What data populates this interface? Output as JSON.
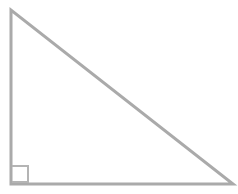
{
  "figure": {
    "type": "geometry-diagram",
    "shape_name": "right-triangle",
    "title": "",
    "caption": "",
    "background_color": "#ffffff",
    "canvas": {
      "width": 238,
      "height": 194
    },
    "stroke": {
      "color": "#aaaaaa",
      "width": 3,
      "linejoin": "miter",
      "linecap": "butt"
    },
    "fill": "none",
    "vertices": [
      {
        "label": "",
        "name": "apex-top-left",
        "x": 11,
        "y": 10
      },
      {
        "label": "",
        "name": "right-angle-bottom-left",
        "x": 11,
        "y": 184
      },
      {
        "label": "",
        "name": "bottom-right",
        "x": 233,
        "y": 184
      }
    ],
    "polygon_points": "11,10 11,184 233,184",
    "edges": [
      {
        "name": "vertical-leg",
        "from": "apex-top-left",
        "to": "right-angle-bottom-left",
        "length_px": 174
      },
      {
        "name": "horizontal-leg",
        "from": "right-angle-bottom-left",
        "to": "bottom-right",
        "length_px": 222
      },
      {
        "name": "hypotenuse",
        "from": "bottom-right",
        "to": "apex-top-left",
        "length_px": 282
      }
    ],
    "right_angle_marker": {
      "at_vertex": "right-angle-bottom-left",
      "size_px": 16,
      "stroke_color": "#b4b4b4",
      "stroke_width": 2,
      "points": "12,166 28,166 28,182 12,182",
      "x": 12,
      "y": 166
    },
    "labels": []
  }
}
